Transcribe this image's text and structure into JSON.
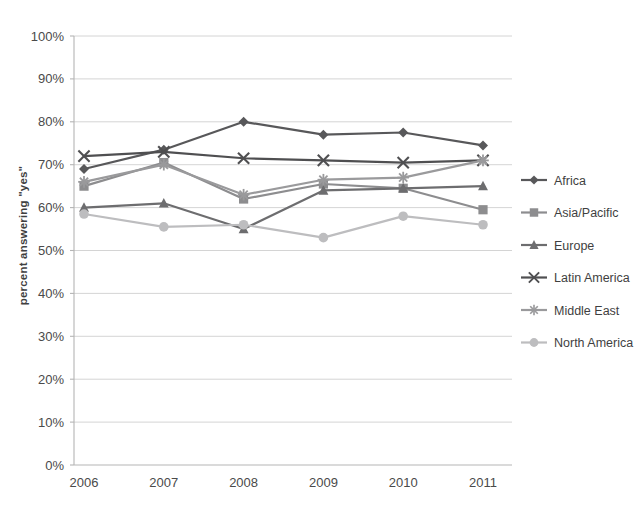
{
  "chart_data": {
    "type": "line",
    "title": "",
    "xlabel": "",
    "ylabel": "percent answering \"yes\"",
    "categories": [
      "2006",
      "2007",
      "2008",
      "2009",
      "2010",
      "2011"
    ],
    "x": [
      2006,
      2007,
      2008,
      2009,
      2010,
      2011
    ],
    "ylim": [
      0,
      100
    ],
    "yticks": [
      0,
      10,
      20,
      30,
      40,
      50,
      60,
      70,
      80,
      90,
      100
    ],
    "ytick_labels": [
      "0%",
      "10%",
      "20%",
      "30%",
      "40%",
      "50%",
      "60%",
      "70%",
      "80%",
      "90%",
      "100%"
    ],
    "grid": true,
    "legend_position": "right",
    "value_suffix": "%",
    "series": [
      {
        "name": "Africa",
        "marker": "diamond",
        "color": "#58585a",
        "values": [
          69,
          73.5,
          80,
          77,
          77.5,
          74.5
        ]
      },
      {
        "name": "Asia/Pacific",
        "marker": "square",
        "color": "#8d8d8f",
        "values": [
          65,
          70.5,
          62,
          65.5,
          64.5,
          59.5
        ]
      },
      {
        "name": "Europe",
        "marker": "triangle",
        "color": "#6d6d6f",
        "values": [
          60,
          61,
          55,
          64,
          64.5,
          65
        ]
      },
      {
        "name": "Latin America",
        "marker": "cross-x",
        "color": "#4f4f51",
        "values": [
          72,
          73,
          71.5,
          71,
          70.5,
          71
        ]
      },
      {
        "name": "Middle East",
        "marker": "asterisk",
        "color": "#9a9a9c",
        "values": [
          66,
          70,
          63,
          66.5,
          67,
          71
        ]
      },
      {
        "name": "North America",
        "marker": "circle",
        "color": "#bdbdbf",
        "values": [
          58.5,
          55.5,
          56,
          53,
          58,
          56
        ]
      }
    ]
  },
  "legend": {
    "items": [
      {
        "label": "Africa"
      },
      {
        "label": "Asia/Pacific"
      },
      {
        "label": "Europe"
      },
      {
        "label": "Latin America"
      },
      {
        "label": "Middle East"
      },
      {
        "label": "North America"
      }
    ]
  },
  "colors": {
    "background": "#ffffff",
    "grid": "#c9c9c9",
    "axis": "#b5b5b5",
    "text": "#3f3f3f"
  }
}
